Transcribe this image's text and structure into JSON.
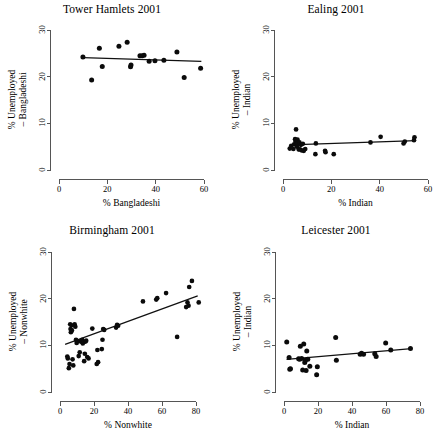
{
  "figure": {
    "layout": "2x2 grid of scatterplots",
    "panel_order": [
      "tower_hamlets",
      "ealing",
      "birmingham",
      "leicester"
    ]
  },
  "chart_data": [
    {
      "id": "tower_hamlets",
      "type": "scatter",
      "title": "Tower Hamlets 2001",
      "xlabel": "% Bangladeshi",
      "ylabel_line1": "% Unemployed",
      "ylabel_line2": "– Bangladeshi",
      "xlim": [
        0,
        60
      ],
      "ylim": [
        0,
        30
      ],
      "xticks": [
        0,
        20,
        40,
        60
      ],
      "yticks": [
        0,
        10,
        20,
        30
      ],
      "grid": false,
      "legend": "none",
      "x": [
        9.9,
        13.5,
        16.7,
        17.9,
        24.8,
        28.2,
        29.6,
        29.8,
        33.5,
        34.4,
        35.2,
        37.3,
        39.7,
        43.4,
        48.8,
        51.8,
        58.6
      ],
      "y": [
        24.2,
        19.3,
        26.1,
        22.2,
        26.5,
        27.4,
        22.1,
        22.5,
        24.5,
        24.5,
        24.6,
        23.3,
        23.4,
        23.5,
        25.3,
        19.8,
        21.8
      ],
      "fit_line": {
        "x1": 9.9,
        "y1": 24.1,
        "x2": 58.9,
        "y2": 23.3
      }
    },
    {
      "id": "ealing",
      "type": "scatter",
      "title": "Ealing 2001",
      "xlabel": "% Indian",
      "ylabel_line1": "% Unemployed",
      "ylabel_line2": "– Indian",
      "xlim": [
        0,
        60
      ],
      "ylim": [
        0,
        30
      ],
      "xticks": [
        0,
        20,
        40,
        60
      ],
      "yticks": [
        0,
        10,
        20,
        30
      ],
      "grid": false,
      "legend": "none",
      "x": [
        2.8,
        3.4,
        4.3,
        4.6,
        5.0,
        5.2,
        5.4,
        5.6,
        5.8,
        6.0,
        6.2,
        6.5,
        6.8,
        7.0,
        7.4,
        7.8,
        8.2,
        8.6,
        9.2,
        13.4,
        13.6,
        17.4,
        17.6,
        21.0,
        36.2,
        40.4,
        49.9,
        50.4,
        54.2,
        54.4
      ],
      "y": [
        4.6,
        5.2,
        4.5,
        5.5,
        6.6,
        6.1,
        8.7,
        5.7,
        5.0,
        6.5,
        5.8,
        4.4,
        5.9,
        4.4,
        5.4,
        4.2,
        5.6,
        4.1,
        4.5,
        3.4,
        5.7,
        4.1,
        3.8,
        3.4,
        5.9,
        7.1,
        5.7,
        6.1,
        6.4,
        7.0
      ],
      "fit_line": {
        "x1": 3.0,
        "y1": 5.4,
        "x2": 55.0,
        "y2": 6.3
      }
    },
    {
      "id": "birmingham",
      "type": "scatter",
      "title": "Birmingham 2001",
      "xlabel": "% Nonwhite",
      "ylabel_line1": "% Unemployed",
      "ylabel_line2": "– Nonwhite",
      "xlim": [
        0,
        80
      ],
      "ylim": [
        0,
        30
      ],
      "xticks": [
        0,
        20,
        40,
        60,
        80
      ],
      "yticks": [
        0,
        10,
        20,
        30
      ],
      "grid": false,
      "legend": "none",
      "x": [
        4.3,
        4.6,
        5.2,
        5.6,
        6.0,
        6.2,
        6.4,
        6.8,
        7.0,
        7.4,
        7.8,
        8.2,
        8.6,
        9.0,
        9.4,
        9.8,
        10.2,
        11.0,
        11.6,
        12.2,
        12.6,
        13.0,
        13.4,
        13.8,
        14.2,
        14.6,
        15.0,
        15.4,
        16.0,
        16.8,
        19.0,
        21.6,
        22.0,
        22.4,
        24.6,
        25.0,
        25.4,
        26.0,
        33.0,
        33.6,
        34.2,
        48.8,
        56.6,
        57.2,
        62.4,
        68.9,
        74.2,
        75.0,
        75.6,
        76.0,
        77.6,
        81.6
      ],
      "y": [
        7.6,
        7.2,
        5.1,
        6.0,
        14.5,
        13.5,
        12.8,
        14.3,
        13.2,
        7.0,
        5.7,
        17.8,
        14.5,
        14.0,
        11.2,
        10.5,
        10.9,
        7.7,
        8.5,
        10.8,
        11.0,
        11.2,
        10.4,
        10.7,
        6.6,
        8.2,
        10.8,
        11.0,
        7.5,
        7.2,
        13.6,
        6.0,
        9.0,
        6.4,
        9.2,
        11.2,
        13.5,
        13.3,
        13.8,
        14.4,
        14.2,
        19.4,
        19.8,
        20.1,
        21.2,
        11.8,
        18.2,
        19.2,
        18.5,
        22.5,
        23.8,
        19.2
      ],
      "fit_line": {
        "x1": 3.0,
        "y1": 10.2,
        "x2": 81.0,
        "y2": 20.6
      }
    },
    {
      "id": "leicester",
      "type": "scatter",
      "title": "Leicester 2001",
      "xlabel": "% Indian",
      "ylabel_line1": "% Unemployed",
      "ylabel_line2": "– Indian",
      "xlim": [
        0,
        80
      ],
      "ylim": [
        0,
        30
      ],
      "xticks": [
        0,
        20,
        40,
        60,
        80
      ],
      "yticks": [
        0,
        10,
        20,
        30
      ],
      "grid": false,
      "legend": "none",
      "x": [
        1.6,
        3.0,
        3.4,
        3.8,
        8.6,
        9.2,
        9.6,
        10.4,
        11.0,
        11.6,
        12.2,
        12.6,
        13.0,
        13.4,
        14.0,
        15.2,
        19.2,
        19.6,
        30.4,
        30.8,
        44.8,
        45.6,
        46.8,
        53.4,
        54.2,
        59.8,
        62.8,
        74.4
      ],
      "y": [
        10.7,
        7.4,
        4.9,
        5.0,
        7.1,
        7.0,
        9.8,
        7.2,
        4.7,
        10.3,
        6.3,
        6.8,
        4.6,
        8.8,
        7.0,
        5.5,
        3.7,
        5.4,
        11.7,
        6.8,
        8.1,
        8.3,
        8.1,
        8.2,
        7.6,
        10.5,
        9.0,
        9.3
      ],
      "fit_line": {
        "x1": 1.5,
        "y1": 7.0,
        "x2": 75.0,
        "y2": 9.3
      }
    }
  ]
}
